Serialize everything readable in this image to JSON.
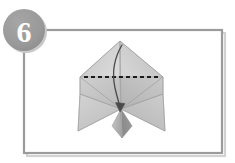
{
  "figure": {
    "kind": "origami-instruction-step",
    "step_label": "6",
    "canvas": {
      "width": 235,
      "height": 163,
      "background": "#ffffff"
    }
  },
  "badge": {
    "label": "6",
    "shape": "circle",
    "fill": "#9a9a9a",
    "fill_shadow": "#8c8c8c",
    "text_color": "#ffffff",
    "cx": 24,
    "cy": 30,
    "r": 21
  },
  "frame": {
    "x": 24,
    "y": 30,
    "width": 198,
    "height": 123,
    "stroke": "#9b9b9b",
    "shadow": "#cfcfcf",
    "stroke_width": 2.2,
    "fill": "#ffffff"
  },
  "model": {
    "apex": {
      "x": 120,
      "y": 41
    },
    "left_extent": {
      "x": 80,
      "y": 77
    },
    "right_extent": {
      "x": 163,
      "y": 77
    },
    "left_wing_tip": {
      "x": 78,
      "y": 131
    },
    "right_wing_tip": {
      "x": 165,
      "y": 131
    },
    "center_point": {
      "x": 121,
      "y": 109
    },
    "tail_bottom": {
      "x": 122,
      "y": 138
    },
    "colors": {
      "paper_light": "#d7d7d7",
      "paper_mid": "#c6c6c6",
      "paper_dark": "#b4b4b4",
      "paper_darker": "#a2a2a2",
      "paper_shadow": "#8f8f8f",
      "crease": "#9a9a9a",
      "outline": "#a8a8a8"
    }
  },
  "fold_line": {
    "type": "valley-fold-dashed",
    "color": "#1b1b1b",
    "x1": 84,
    "x2": 159,
    "y": 77,
    "stroke_width": 1.9,
    "dash": "4 3"
  },
  "arrow": {
    "type": "fold-direction-curved-arrow",
    "color": "#4a4a4a",
    "start": {
      "x": 122,
      "y": 45
    },
    "end": {
      "x": 120,
      "y": 110
    },
    "stroke_width": 1.3,
    "head": "solid-triangle"
  }
}
